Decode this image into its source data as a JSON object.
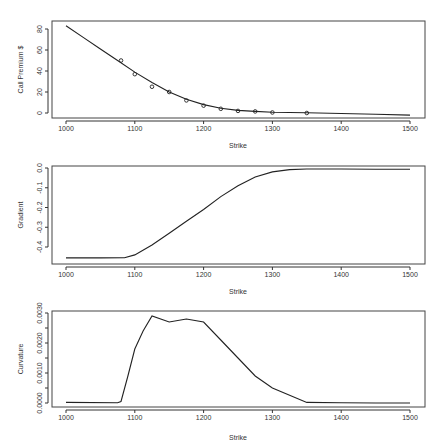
{
  "chart_data": [
    {
      "type": "line",
      "title": "",
      "xlabel": "Strike",
      "ylabel": "Call Premium $",
      "xlim": [
        1000,
        1500
      ],
      "ylim": [
        0,
        80
      ],
      "xticks": [
        1000,
        1100,
        1200,
        1300,
        1400,
        1500
      ],
      "yticks": [
        0,
        20,
        40,
        60,
        80
      ],
      "grid": false,
      "series": [
        {
          "name": "fitted call price",
          "kind": "line",
          "x": [
            1000,
            1025,
            1050,
            1075,
            1100,
            1125,
            1150,
            1175,
            1200,
            1225,
            1250,
            1275,
            1300,
            1350,
            1400,
            1450,
            1500
          ],
          "values": [
            83,
            72,
            61,
            50,
            39,
            29,
            20,
            13,
            8,
            4.5,
            2.5,
            1.5,
            0.8,
            0.3,
            -0.5,
            -1.2,
            -2
          ]
        },
        {
          "name": "observed premiums",
          "kind": "scatter",
          "x": [
            1080,
            1100,
            1125,
            1150,
            1175,
            1200,
            1225,
            1250,
            1275,
            1300,
            1350
          ],
          "values": [
            50,
            37,
            25,
            20,
            12,
            7,
            4,
            2,
            1.5,
            0.5,
            0
          ]
        }
      ]
    },
    {
      "type": "line",
      "title": "",
      "xlabel": "Strike",
      "ylabel": "Gradient",
      "xlim": [
        1000,
        1500
      ],
      "ylim": [
        -0.46,
        0.0
      ],
      "xticks": [
        1000,
        1100,
        1200,
        1300,
        1400,
        1500
      ],
      "yticks": [
        0.0,
        -0.1,
        -0.2,
        -0.3,
        -0.4
      ],
      "ytick_labels": [
        "0.0",
        "-0.1",
        "-0.2",
        "-0.3",
        "-0.4"
      ],
      "grid": false,
      "series": [
        {
          "name": "gradient",
          "kind": "line",
          "x": [
            1000,
            1050,
            1085,
            1100,
            1125,
            1150,
            1175,
            1200,
            1225,
            1250,
            1275,
            1300,
            1325,
            1350,
            1400,
            1450,
            1500
          ],
          "values": [
            -0.455,
            -0.455,
            -0.454,
            -0.44,
            -0.39,
            -0.33,
            -0.27,
            -0.21,
            -0.145,
            -0.09,
            -0.045,
            -0.02,
            -0.008,
            -0.005,
            -0.005,
            -0.006,
            -0.006
          ]
        }
      ]
    },
    {
      "type": "line",
      "title": "",
      "xlabel": "Strike",
      "ylabel": "Curvature",
      "xlim": [
        1000,
        1500
      ],
      "ylim": [
        0.0,
        0.003
      ],
      "xticks": [
        1000,
        1100,
        1200,
        1300,
        1400,
        1500
      ],
      "yticks": [
        0.0,
        0.0005,
        0.001,
        0.0015,
        0.002,
        0.0025,
        0.003
      ],
      "ytick_labels": [
        "0.0000",
        "",
        "0.0010",
        "",
        "0.0020",
        "",
        "0.0030"
      ],
      "grid": false,
      "series": [
        {
          "name": "curvature",
          "kind": "line",
          "x": [
            1000,
            1075,
            1080,
            1090,
            1100,
            1112,
            1125,
            1150,
            1175,
            1200,
            1225,
            1250,
            1275,
            1300,
            1350,
            1400,
            1450,
            1500
          ],
          "values": [
            2e-05,
            1e-05,
            5e-05,
            0.0009,
            0.0018,
            0.0024,
            0.0029,
            0.0027,
            0.0028,
            0.0027,
            0.0021,
            0.0015,
            0.0009,
            0.0005,
            2e-05,
            1e-05,
            0.0,
            0.0
          ]
        }
      ]
    }
  ]
}
